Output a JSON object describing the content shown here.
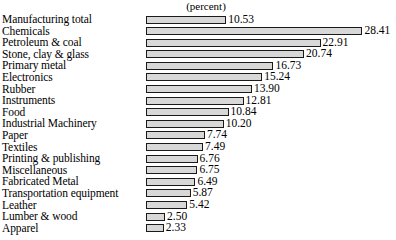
{
  "chart_data": {
    "type": "bar",
    "title": "",
    "subtitle": "",
    "unit_header": "(percent)",
    "orientation": "horizontal",
    "xlabel": "",
    "ylabel": "",
    "grid": false,
    "legend": false,
    "legend_position": "none",
    "xlim": [
      0,
      30
    ],
    "axis_origin_value": 0,
    "categories": [
      "Manufacturing total",
      "Chemicals",
      "Petroleum & coal",
      "Stone, clay & glass",
      "Primary metal",
      "Electronics",
      "Rubber",
      "Instruments",
      "Food",
      "Industrial Machinery",
      "Paper",
      "Textiles",
      "Printing & publishing",
      "Miscellaneous",
      "Fabricated Metal",
      "Transportation equipment",
      "Leather",
      "Lumber & wood",
      "Apparel"
    ],
    "values": [
      10.53,
      28.41,
      22.91,
      20.74,
      16.73,
      15.24,
      13.9,
      12.81,
      10.84,
      10.2,
      7.74,
      7.49,
      6.76,
      6.75,
      6.49,
      5.87,
      5.42,
      2.5,
      2.33
    ],
    "value_labels": [
      "10.53",
      "28.41",
      "22.91",
      "20.74",
      "16.73",
      "15.24",
      "13.90",
      "12.81",
      "10.84",
      "10.20",
      "7.74",
      "7.49",
      "6.76",
      "6.75",
      "6.49",
      "5.87",
      "5.42",
      "2.50",
      "2.33"
    ]
  },
  "style": {
    "bar_fill": "#d8d8d8",
    "bar_border": "#1a1a1a",
    "text_color": "#000000",
    "background": "#ffffff"
  }
}
